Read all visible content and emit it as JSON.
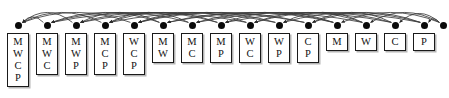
{
  "figure": {
    "type": "hasse-diagram",
    "title": "",
    "element_universe": [
      "M",
      "W",
      "C",
      "P"
    ],
    "node_count": 16,
    "box_count": 15,
    "colors": {
      "background": "#ffffff",
      "dot": "#0a0a0a",
      "box_border": "#1a1a1a",
      "box_fill": "#ffffff",
      "arc_stroke": "#3c3c3c",
      "text": "#111111",
      "shadow": "#787878"
    },
    "layout": {
      "width": 449,
      "height": 98,
      "first_node_x": 18,
      "node_spacing": 29,
      "dot_y": 25,
      "box_top": 33,
      "box_width": 22,
      "row_height": 12
    }
  },
  "nodes": [
    {
      "index": 0,
      "x": 18,
      "label": "MWCP",
      "letters": [
        "M",
        "W",
        "C",
        "P"
      ],
      "size": 4,
      "has_box": true
    },
    {
      "index": 1,
      "x": 47,
      "label": "MWC",
      "letters": [
        "M",
        "W",
        "C"
      ],
      "size": 3,
      "has_box": true
    },
    {
      "index": 2,
      "x": 76,
      "label": "MWP",
      "letters": [
        "M",
        "W",
        "P"
      ],
      "size": 3,
      "has_box": true
    },
    {
      "index": 3,
      "x": 105,
      "label": "MCP",
      "letters": [
        "M",
        "C",
        "P"
      ],
      "size": 3,
      "has_box": true
    },
    {
      "index": 4,
      "x": 134,
      "label": "WCP",
      "letters": [
        "W",
        "C",
        "P"
      ],
      "size": 3,
      "has_box": true
    },
    {
      "index": 5,
      "x": 163,
      "label": "MW",
      "letters": [
        "M",
        "W"
      ],
      "size": 2,
      "has_box": true
    },
    {
      "index": 6,
      "x": 192,
      "label": "MC",
      "letters": [
        "M",
        "C"
      ],
      "size": 2,
      "has_box": true
    },
    {
      "index": 7,
      "x": 221,
      "label": "MP",
      "letters": [
        "M",
        "P"
      ],
      "size": 2,
      "has_box": true
    },
    {
      "index": 8,
      "x": 250,
      "label": "WC",
      "letters": [
        "W",
        "C"
      ],
      "size": 2,
      "has_box": true
    },
    {
      "index": 9,
      "x": 279,
      "label": "WP",
      "letters": [
        "W",
        "P"
      ],
      "size": 2,
      "has_box": true
    },
    {
      "index": 10,
      "x": 308,
      "label": "CP",
      "letters": [
        "C",
        "P"
      ],
      "size": 2,
      "has_box": true
    },
    {
      "index": 11,
      "x": 337,
      "label": "M",
      "letters": [
        "M"
      ],
      "size": 1,
      "has_box": true
    },
    {
      "index": 12,
      "x": 366,
      "label": "W",
      "letters": [
        "W"
      ],
      "size": 1,
      "has_box": true
    },
    {
      "index": 13,
      "x": 395,
      "label": "C",
      "letters": [
        "C"
      ],
      "size": 1,
      "has_box": true
    },
    {
      "index": 14,
      "x": 424,
      "label": "P",
      "letters": [
        "P"
      ],
      "size": 1,
      "has_box": true
    },
    {
      "index": 15,
      "x": 443,
      "label": "",
      "letters": [],
      "size": 0,
      "has_box": false
    }
  ],
  "edges": [
    {
      "from": 1,
      "to": 0
    },
    {
      "from": 2,
      "to": 0
    },
    {
      "from": 3,
      "to": 0
    },
    {
      "from": 4,
      "to": 0
    },
    {
      "from": 5,
      "to": 1
    },
    {
      "from": 5,
      "to": 2
    },
    {
      "from": 6,
      "to": 1
    },
    {
      "from": 6,
      "to": 3
    },
    {
      "from": 7,
      "to": 2
    },
    {
      "from": 7,
      "to": 3
    },
    {
      "from": 8,
      "to": 1
    },
    {
      "from": 8,
      "to": 4
    },
    {
      "from": 9,
      "to": 2
    },
    {
      "from": 9,
      "to": 4
    },
    {
      "from": 10,
      "to": 3
    },
    {
      "from": 10,
      "to": 4
    },
    {
      "from": 11,
      "to": 5
    },
    {
      "from": 11,
      "to": 6
    },
    {
      "from": 11,
      "to": 7
    },
    {
      "from": 12,
      "to": 5
    },
    {
      "from": 12,
      "to": 8
    },
    {
      "from": 12,
      "to": 9
    },
    {
      "from": 13,
      "to": 6
    },
    {
      "from": 13,
      "to": 8
    },
    {
      "from": 13,
      "to": 10
    },
    {
      "from": 14,
      "to": 7
    },
    {
      "from": 14,
      "to": 9
    },
    {
      "from": 14,
      "to": 10
    },
    {
      "from": 15,
      "to": 11
    },
    {
      "from": 15,
      "to": 12
    },
    {
      "from": 15,
      "to": 13
    },
    {
      "from": 15,
      "to": 14
    }
  ]
}
